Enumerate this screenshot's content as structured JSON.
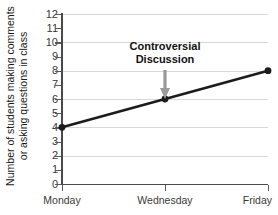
{
  "chart_data": {
    "type": "line",
    "title": "",
    "xlabel": "",
    "ylabel_line1": "Number of students making comments",
    "ylabel_line2": "or asking questions in class",
    "categories": [
      "Monday",
      "Wednesday",
      "Friday"
    ],
    "values": [
      4,
      6,
      8
    ],
    "series": [
      {
        "name": "students participating",
        "values": [
          4,
          6,
          8
        ]
      }
    ],
    "ylim": [
      0,
      12
    ],
    "ytick_values": [
      0,
      1,
      2,
      3,
      4,
      5,
      6,
      7,
      8,
      9,
      10,
      11,
      12
    ],
    "ytick_labels": [
      "0",
      "1",
      "2",
      "3",
      "4",
      "5",
      "6",
      "7",
      "8",
      "9",
      "10",
      "11",
      "12"
    ],
    "gridline_values": [
      2,
      4,
      6,
      8,
      10,
      12
    ],
    "grid": true,
    "legend": "none",
    "annotations": [
      {
        "text_line1": "Controversial",
        "text_line2": "Discussion",
        "points_to_category": "Wednesday",
        "points_to_value": 6
      }
    ],
    "colors": {
      "line": "#1c1c1c",
      "marker": "#1c1c1c",
      "grid": "#d7d7d7",
      "axis": "#4a4a4a",
      "arrow": "#9a9a9a",
      "text": "#1a1a1a",
      "background": "#ffffff"
    }
  }
}
